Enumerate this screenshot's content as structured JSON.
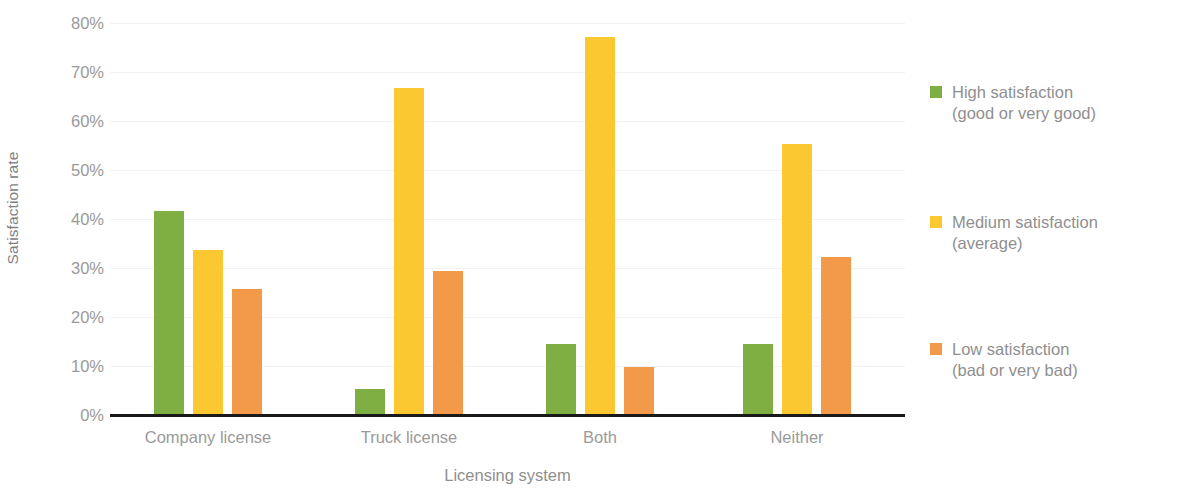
{
  "chart_data": {
    "type": "bar",
    "title": "",
    "xlabel": "Licensing system",
    "ylabel": "Satisfaction rate",
    "categories": [
      "Company license",
      "Truck license",
      "Both",
      "Neither"
    ],
    "series": [
      {
        "name": "High satisfaction (good or very good)",
        "legend_line1": "High satisfaction",
        "legend_line2": "(good or very good)",
        "color": "#7FAE42",
        "values": [
          41.5,
          5.1,
          14.2,
          14.2
        ]
      },
      {
        "name": "Medium satisfaction (average)",
        "legend_line1": "Medium satisfaction",
        "legend_line2": "(average)",
        "color": "#FBC831",
        "values": [
          33.5,
          66.5,
          77.0,
          55.2
        ]
      },
      {
        "name": "Low satisfaction (bad or very bad)",
        "legend_line1": "Low satisfaction",
        "legend_line2": "(bad or very bad)",
        "color": "#F2994A",
        "values": [
          25.5,
          29.2,
          9.5,
          32.0
        ]
      }
    ],
    "ylim": [
      0,
      80
    ],
    "ytick_labels": [
      "0%",
      "10%",
      "20%",
      "30%",
      "40%",
      "50%",
      "60%",
      "70%",
      "80%"
    ],
    "ytick_values": [
      0,
      10,
      20,
      30,
      40,
      50,
      60,
      70,
      80
    ],
    "grid": true,
    "grid_axis": "y",
    "legend_position": "right",
    "axis_color": "#1a1a1a",
    "grid_color": "#f2f2f2",
    "tick_label_color": "#9a9a9a",
    "axis_title_color": "#8f8f8f",
    "background": "#ffffff"
  }
}
